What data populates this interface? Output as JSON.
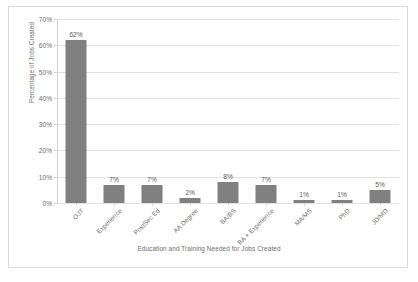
{
  "chart_data": {
    "type": "bar",
    "title": "",
    "xlabel": "Education and Training Needed for Jobs Created",
    "ylabel": "Percentage of Jobs Created",
    "categories": [
      "OJT",
      "Experience",
      "PostSec Ed",
      "AA Degree",
      "BA/BS",
      "BA + Experience",
      "MA/MS",
      "PhD",
      "JD/MD"
    ],
    "values": [
      62,
      7,
      7,
      2,
      8,
      7,
      1,
      1,
      5
    ],
    "data_labels": [
      "62%",
      "7%",
      "7%",
      "2%",
      "8%",
      "7%",
      "1%",
      "1%",
      "5%"
    ],
    "ylim": [
      0,
      70
    ],
    "ytick_values": [
      0,
      10,
      20,
      30,
      40,
      50,
      60,
      70
    ],
    "ytick_labels": [
      "0%",
      "10%",
      "20%",
      "30%",
      "40%",
      "50%",
      "60%",
      "70%"
    ],
    "grid": "horizontal",
    "legend": "none",
    "bar_color": "#808080",
    "gridline_color": "#e2e2e2",
    "axis_text_color": "#6d6d6d",
    "plot_background": "#ffffff",
    "border_color": "#d9d9d9"
  }
}
